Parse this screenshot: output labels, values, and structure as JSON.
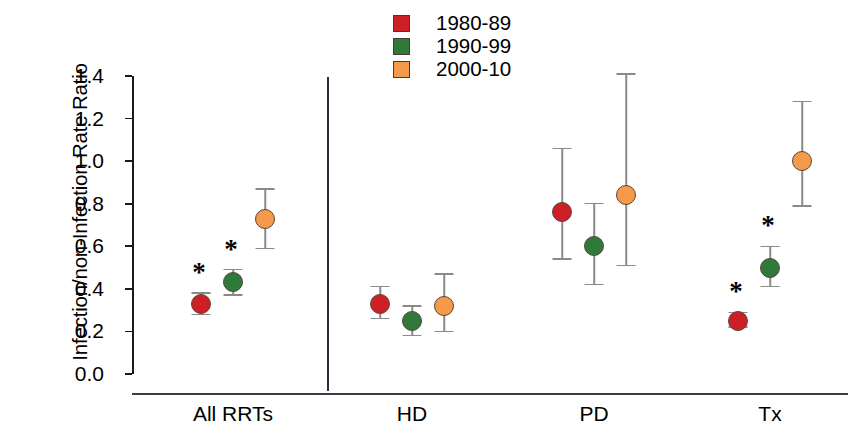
{
  "chart_data": {
    "type": "scatter",
    "title": "",
    "xlabel": "",
    "ylabel": "Infection/non-Infection Rate Ratio",
    "categories": [
      "All RRTs",
      "HD",
      "PD",
      "Tx"
    ],
    "ylim": [
      0.0,
      1.4
    ],
    "y_ticks": [
      "0.0",
      "0.2",
      "0.4",
      "0.6",
      "0.8",
      "1.0",
      "1.2",
      "1.4"
    ],
    "grid": false,
    "legend_position": "top-center",
    "error_bars": "95% confidence interval",
    "significance_marker": "*",
    "series": [
      {
        "name": "1980-89",
        "color": "#cc2026",
        "values": [
          0.33,
          0.33,
          0.76,
          0.25
        ],
        "ci_low": [
          0.28,
          0.26,
          0.54,
          0.22
        ],
        "ci_high": [
          0.38,
          0.41,
          1.06,
          0.29
        ],
        "significant": [
          true,
          false,
          false,
          true
        ]
      },
      {
        "name": "1990-99",
        "color": "#2f7a3b",
        "values": [
          0.43,
          0.25,
          0.6,
          0.5
        ],
        "ci_low": [
          0.37,
          0.18,
          0.42,
          0.41
        ],
        "ci_high": [
          0.49,
          0.32,
          0.8,
          0.6
        ],
        "significant": [
          true,
          false,
          false,
          true
        ]
      },
      {
        "name": "2000-10",
        "color": "#f59a4a",
        "values": [
          0.73,
          0.32,
          0.84,
          1.0
        ],
        "ci_low": [
          0.59,
          0.2,
          0.51,
          0.79
        ],
        "ci_high": [
          0.87,
          0.47,
          1.41,
          1.28
        ],
        "significant": [
          false,
          false,
          false,
          false
        ]
      }
    ]
  },
  "legend": {
    "entries": [
      {
        "label": "1980-89",
        "color": "#cc2026"
      },
      {
        "label": "1990-99",
        "color": "#2f7a3b"
      },
      {
        "label": "2000-10",
        "color": "#f59a4a"
      }
    ]
  },
  "axes": {
    "y_title": "Infection/non-Infection Rate Ratio",
    "y_tick_labels": [
      "1.4",
      "1.2",
      "1.0",
      "0.8",
      "0.6",
      "0.4",
      "0.2",
      "0.0"
    ],
    "x_tick_labels": [
      "All RRTs",
      "HD",
      "PD",
      "Tx"
    ]
  },
  "colors": {
    "series_1980_89": "#cc2026",
    "series_1990_99": "#2f7a3b",
    "series_2000_10": "#f59a4a",
    "axis": "#1a1a1a",
    "errorbar": "#8a8a8a",
    "divider": "#2a2a38",
    "background": "#ffffff"
  }
}
